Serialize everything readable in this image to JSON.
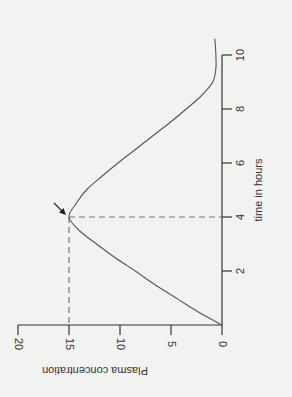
{
  "chart_data": {
    "type": "line",
    "title": "",
    "xlabel": "time in hours",
    "ylabel": "Plasma concentration",
    "orientation": "rotated 90 degrees clockwise (time axis vertical on right, concentration axis horizontal at bottom)",
    "xlim": [
      0,
      10.6
    ],
    "ylim": [
      0,
      20
    ],
    "x_ticks": [
      2,
      4,
      6,
      8,
      10
    ],
    "y_ticks": [
      0,
      5,
      10,
      15,
      20
    ],
    "grid": false,
    "legend": null,
    "series": [
      {
        "name": "Plasma concentration",
        "x": [
          0,
          0.5,
          1,
          1.5,
          2,
          2.5,
          3,
          3.5,
          4,
          4.5,
          5,
          5.5,
          6,
          6.5,
          7,
          7.5,
          8,
          8.5,
          9,
          9.5,
          10,
          10.6
        ],
        "values": [
          0,
          2.4,
          4.5,
          6.6,
          8.5,
          10.5,
          12.3,
          14.0,
          15.0,
          14.3,
          13.3,
          11.8,
          10.2,
          8.5,
          6.8,
          5.1,
          3.5,
          2.0,
          0.9,
          0.6,
          0.6,
          0.7
        ]
      }
    ],
    "annotations": [
      {
        "type": "dashed-guide",
        "x": 4,
        "y": 15,
        "description": "Dashed lines from peak to both axes"
      },
      {
        "type": "arrow",
        "target": {
          "x": 4,
          "y": 15
        },
        "description": "Arrow pointing to peak concentration"
      }
    ]
  },
  "labels": {
    "x_title": "time in hours",
    "y_title": "Plasma concentration",
    "x_tick_labels": [
      "2",
      "4",
      "6",
      "8",
      "10"
    ],
    "y_tick_labels": [
      "0",
      "5",
      "10",
      "15",
      "20"
    ]
  }
}
